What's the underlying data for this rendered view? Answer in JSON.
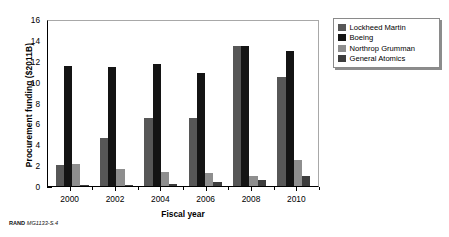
{
  "figure": {
    "footer_prefix": "RAND",
    "footer_code": "MG1133-S.4"
  },
  "chart_data": {
    "type": "bar",
    "title": "",
    "xlabel": "Fiscal year",
    "ylabel": "Procurement funding ($2011B)",
    "categories": [
      "2000",
      "2002",
      "2004",
      "2006",
      "2008",
      "2010"
    ],
    "ylim": [
      0,
      16
    ],
    "yticks": [
      0,
      2,
      4,
      6,
      8,
      10,
      12,
      14,
      16
    ],
    "ytick_labels": [
      "0",
      "2",
      "4",
      "6",
      "8",
      "10",
      "12",
      "14",
      "16"
    ],
    "grid": false,
    "legend_position": "right-outside",
    "series": [
      {
        "name": "Lockheed Martin",
        "color": "#575757",
        "values": [
          2.0,
          4.6,
          6.5,
          6.5,
          13.4,
          10.4
        ]
      },
      {
        "name": "Boeing",
        "color": "#141414",
        "values": [
          11.5,
          11.4,
          11.7,
          10.8,
          13.4,
          12.9
        ]
      },
      {
        "name": "Northrop Grumman",
        "color": "#8e8e8e",
        "values": [
          2.1,
          1.6,
          1.3,
          1.2,
          1.0,
          2.5
        ]
      },
      {
        "name": "General Atomics",
        "color": "#3d3d3d",
        "values": [
          0.1,
          0.1,
          0.2,
          0.35,
          0.55,
          1.0
        ]
      }
    ]
  }
}
